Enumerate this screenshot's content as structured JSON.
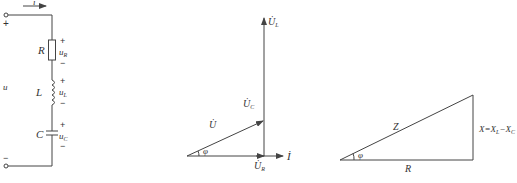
{
  "circuit": {
    "current_label": "i",
    "source_label": "u",
    "top_terminal_sign": "+",
    "bottom_terminal_sign": "−",
    "components": [
      {
        "name": "R",
        "voltage": "u",
        "voltage_sub": "R",
        "plus": "+",
        "minus": "−"
      },
      {
        "name": "L",
        "voltage": "u",
        "voltage_sub": "L",
        "plus": "+",
        "minus": "−"
      },
      {
        "name": "C",
        "voltage": "u",
        "voltage_sub": "C",
        "plus": "+",
        "minus": "−"
      }
    ]
  },
  "phasor": {
    "U": "U̇",
    "UC": "U̇",
    "UC_sub": "C",
    "UL": "U̇",
    "UL_sub": "L",
    "UR": "U̇",
    "UR_sub": "R",
    "I": "İ",
    "angle": "φ"
  },
  "impedance_triangle": {
    "hypotenuse": "Z",
    "base": "R",
    "angle": "φ",
    "side": "X=X",
    "side_sub1": "L",
    "side_mid": "−X",
    "side_sub2": "C"
  }
}
